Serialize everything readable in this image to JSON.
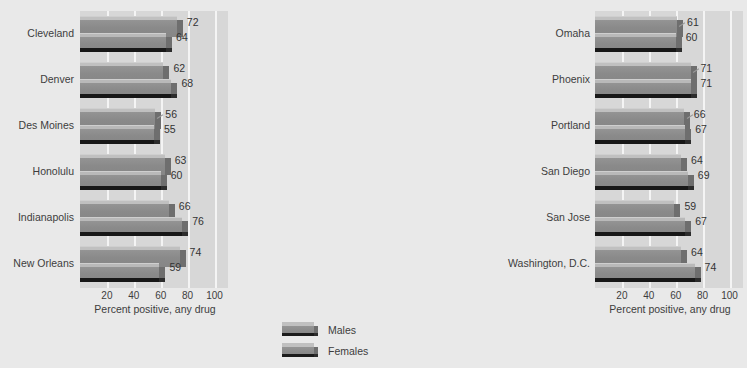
{
  "chart_data": {
    "type": "bar",
    "orientation": "horizontal",
    "title": "",
    "xlabel": "Percent positive, any drug",
    "ylabel": "",
    "xlim": [
      0,
      110
    ],
    "xticks": [
      20,
      40,
      60,
      80,
      100
    ],
    "grid": true,
    "legend_position": "bottom-center",
    "series": [
      {
        "name": "Males",
        "color": "#8c8c8c"
      },
      {
        "name": "Females",
        "color": "#8c8c8c"
      }
    ],
    "panels": [
      {
        "id": "left",
        "xlabel": "Percent positive, any drug",
        "categories": [
          "Cleveland",
          "Denver",
          "Des Moines",
          "Honolulu",
          "Indianapolis",
          "New Orleans"
        ],
        "males": [
          72,
          62,
          56,
          63,
          66,
          74
        ],
        "females": [
          64,
          68,
          55,
          60,
          76,
          59
        ]
      },
      {
        "id": "right",
        "xlabel": "Percent positive, any drug",
        "categories": [
          "Omaha",
          "Phoenix",
          "Portland",
          "San Diego",
          "San Jose",
          "Washington, D.C."
        ],
        "males": [
          61,
          71,
          66,
          64,
          59,
          64
        ],
        "females": [
          60,
          71,
          67,
          69,
          67,
          74
        ]
      }
    ]
  },
  "axis": {
    "ticks": [
      "20",
      "40",
      "60",
      "80",
      "100"
    ],
    "title": "Percent positive, any drug"
  },
  "legend": {
    "items": [
      {
        "label": "Males"
      },
      {
        "label": "Females"
      }
    ]
  },
  "colors": {
    "page_background": "#e9e9e9",
    "plot_background": "#d7d7d7",
    "gridline": "#f4f4f4",
    "bar_face": "#8c8c8c",
    "bar_top": "#c0c0c0",
    "bar_cap": "#6e6e6e",
    "bar_shadow": "#171717",
    "text": "#3d3d3d"
  }
}
